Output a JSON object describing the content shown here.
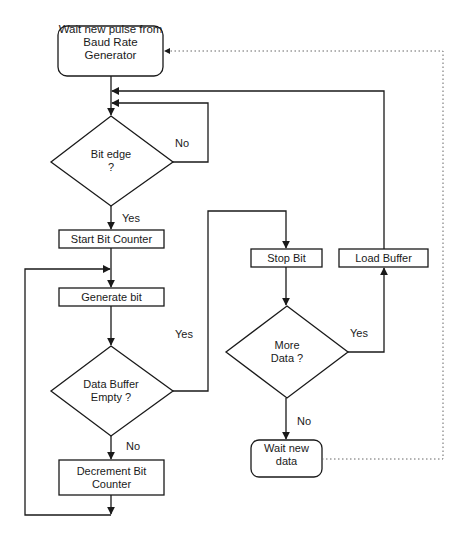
{
  "diagram": {
    "type": "flowchart",
    "nodes": {
      "wait_pulse": {
        "shape": "rounded-rect",
        "line1": "Wait new pulse from",
        "line2": "Baud Rate Generator"
      },
      "bit_edge": {
        "shape": "diamond",
        "line1": "Bit edge",
        "line2": "?"
      },
      "start_counter": {
        "shape": "rect",
        "label": "Start Bit Counter"
      },
      "generate_bit": {
        "shape": "rect",
        "label": "Generate bit"
      },
      "data_buffer_empty": {
        "shape": "diamond",
        "line1": "Data Buffer",
        "line2": "Empty ?"
      },
      "decrement_counter": {
        "shape": "rect",
        "line1": "Decrement Bit",
        "line2": "Counter"
      },
      "stop_bit": {
        "shape": "rect",
        "label": "Stop Bit"
      },
      "more_data": {
        "shape": "diamond",
        "line1": "More",
        "line2": "Data ?"
      },
      "load_buffer": {
        "shape": "rect",
        "label": "Load Buffer"
      },
      "wait_data": {
        "shape": "rounded-rect",
        "line1": "Wait new",
        "line2": "data"
      }
    },
    "edge_labels": {
      "bit_edge_no": "No",
      "bit_edge_yes": "Yes",
      "buffer_empty_yes": "Yes",
      "buffer_empty_no": "No",
      "more_data_yes": "Yes",
      "more_data_no": "No"
    },
    "colors": {
      "stroke": "#1a1a1a",
      "dotted": "#666666",
      "background": "#ffffff"
    }
  }
}
